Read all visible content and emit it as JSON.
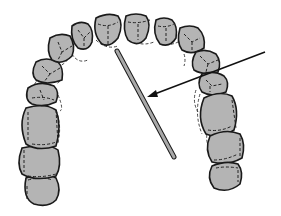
{
  "figure": {
    "elements": {
      "arch": "maxillary-dental-arch",
      "rod": "instrument-rod",
      "pointer": "arrow-pointer"
    },
    "colors": {
      "tooth_fill": "#b4b4b4",
      "outline": "#1a1a1a",
      "rod_fill": "#a8a8a8",
      "background": "#ffffff"
    }
  }
}
